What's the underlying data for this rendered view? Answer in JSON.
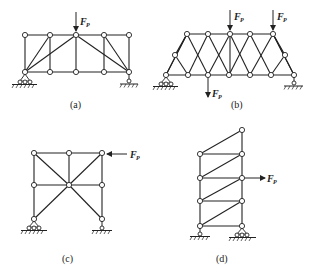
{
  "figure": {
    "panels": [
      {
        "id": "a",
        "caption": "(a)",
        "force_label": "F",
        "force_subscript": "P",
        "forces": 1
      },
      {
        "id": "b",
        "caption": "(b)",
        "force_label": "F",
        "force_subscript": "P",
        "forces": 3
      },
      {
        "id": "c",
        "caption": "(c)",
        "force_label": "F",
        "force_subscript": "P",
        "forces": 1
      },
      {
        "id": "d",
        "caption": "(d)",
        "force_label": "F",
        "force_subscript": "P",
        "forces": 1
      }
    ]
  },
  "colors": {
    "line": "#222222",
    "background": "#ffffff"
  }
}
